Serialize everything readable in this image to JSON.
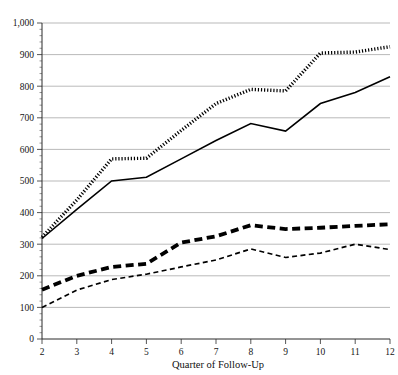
{
  "chart_data": {
    "type": "line",
    "title": "",
    "xlabel": "Quarter of Follow-Up",
    "ylabel": "",
    "x": [
      2,
      3,
      4,
      5,
      6,
      7,
      8,
      9,
      10,
      11,
      12
    ],
    "xtick_labels": [
      "2",
      "3",
      "4",
      "5",
      "6",
      "7",
      "8",
      "9",
      "10",
      "11",
      "12"
    ],
    "ytick_labels": [
      "0",
      "100",
      "200",
      "300",
      "400",
      "500",
      "600",
      "700",
      "800",
      "900",
      "1,000"
    ],
    "ytick_values": [
      0,
      100,
      200,
      300,
      400,
      500,
      600,
      700,
      800,
      900,
      1000
    ],
    "ylim": [
      0,
      1000
    ],
    "xlim": [
      2,
      12
    ],
    "grid": "horizontal",
    "legend": "none",
    "minor_ticks": true,
    "series": [
      {
        "name": "series-dotted-upper",
        "style": "dotted-thick",
        "values": [
          322,
          440,
          570,
          572,
          660,
          745,
          790,
          785,
          905,
          908,
          925
        ]
      },
      {
        "name": "series-solid-upper",
        "style": "solid",
        "values": [
          318,
          410,
          500,
          512,
          570,
          628,
          682,
          658,
          745,
          780,
          830
        ]
      },
      {
        "name": "series-dashed-thick-lower",
        "style": "dashed-thick",
        "values": [
          156,
          200,
          228,
          238,
          305,
          325,
          360,
          348,
          352,
          358,
          363
        ]
      },
      {
        "name": "series-dashed-thin-lower",
        "style": "dashed-thin",
        "values": [
          100,
          155,
          188,
          205,
          228,
          250,
          285,
          258,
          272,
          300,
          283
        ]
      }
    ]
  },
  "axes": {
    "x_axis_title": "Quarter of Follow-Up"
  },
  "clipped_header": {
    "text": ""
  }
}
